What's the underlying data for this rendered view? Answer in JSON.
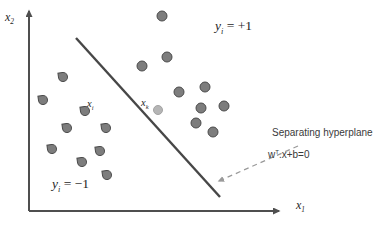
{
  "figure": {
    "axis": {
      "x_label_base": "x",
      "x_label_sub": "1",
      "y_label_base": "x",
      "y_label_sub": "2"
    },
    "regions": {
      "positive": {
        "base": "y",
        "sub": "i",
        "rest": " = +1"
      },
      "negative": {
        "base": "y",
        "sub": "i",
        "rest": " = −1"
      }
    },
    "point_labels": {
      "xi": {
        "base": "x",
        "sub": "i"
      },
      "xk": {
        "base": "x",
        "sub": "k"
      }
    },
    "annotation": {
      "title": "Separating hyperplane",
      "formula_base": "w",
      "formula_sup": "T",
      "formula_rest": ".x+b=0"
    },
    "colors": {
      "axis": "#4f4f4f",
      "hyperplane": "#474747",
      "point_fill": "#7d7d7d",
      "point_stroke": "#4b4b4b",
      "highlight_fill": "#b5b5b5",
      "highlight_stroke": "#a3a3a3",
      "arrow": "#9a9a9a",
      "text": "#3a3a3a",
      "math_text": "#1f1f1f"
    },
    "geometry": {
      "y_axis": {
        "x": 29,
        "y1": 211,
        "y2": 11
      },
      "x_axis": {
        "y": 211,
        "x1": 29,
        "x2": 279
      },
      "hyperplane": {
        "x1": 76,
        "y1": 38,
        "x2": 220,
        "y2": 197
      },
      "annotation_arrow": {
        "x1": 298,
        "y1": 146,
        "x2": 219,
        "y2": 181
      }
    },
    "points": {
      "positive": [
        [
          162,
          16
        ],
        [
          167,
          57
        ],
        [
          142,
          66
        ],
        [
          179,
          92
        ],
        [
          205,
          87
        ],
        [
          201,
          108
        ],
        [
          224,
          106
        ],
        [
          196,
          123
        ],
        [
          213,
          132
        ]
      ],
      "negative": [
        [
          63,
          77
        ],
        [
          43,
          100
        ],
        [
          85,
          111
        ],
        [
          67,
          128
        ],
        [
          106,
          128
        ],
        [
          52,
          149
        ],
        [
          100,
          151
        ],
        [
          82,
          162
        ],
        [
          107,
          175
        ]
      ],
      "highlight": [
        158,
        110
      ]
    }
  }
}
